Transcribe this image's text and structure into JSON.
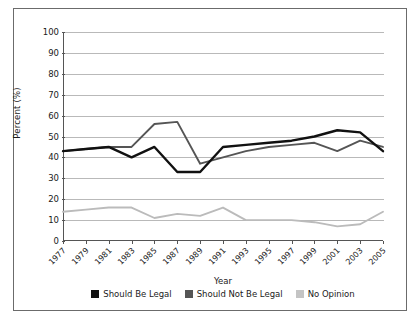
{
  "chart_data": {
    "type": "line",
    "title": "",
    "xlabel": "Year",
    "ylabel": "Percent (%)",
    "ylim": [
      0,
      100
    ],
    "ytick_step": 10,
    "yticks": [
      0,
      10,
      20,
      30,
      40,
      50,
      60,
      70,
      80,
      90,
      100
    ],
    "grid": true,
    "legend_position": "bottom",
    "x": [
      1977,
      1979,
      1981,
      1983,
      1985,
      1987,
      1989,
      1991,
      1993,
      1995,
      1997,
      1999,
      2001,
      2003,
      2005
    ],
    "categories": [
      "1977",
      "1979",
      "1981",
      "1983",
      "1985",
      "1987",
      "1989",
      "1991",
      "1993",
      "1995",
      "1997",
      "1999",
      "2001",
      "2003",
      "2005"
    ],
    "series": [
      {
        "name": "Should Be Legal",
        "color": "#111111",
        "values": [
          43,
          44,
          45,
          40,
          45,
          33,
          33,
          45,
          46,
          47,
          48,
          50,
          53,
          52,
          43
        ]
      },
      {
        "name": "Should Not Be Legal",
        "color": "#555555",
        "values": [
          43,
          44,
          45,
          45,
          56,
          57,
          37,
          40,
          43,
          45,
          46,
          47,
          43,
          48,
          45
        ]
      },
      {
        "name": "No Opinion",
        "color": "#bbbbbb",
        "values": [
          14,
          15,
          16,
          16,
          11,
          13,
          12,
          16,
          10,
          10,
          10,
          9,
          7,
          8,
          14
        ]
      }
    ]
  },
  "axes": {
    "ylabel": "Percent (%)",
    "xlabel": "Year"
  },
  "legend": {
    "items": [
      {
        "label": "Should Be Legal",
        "color": "#111111"
      },
      {
        "label": "Should Not Be Legal",
        "color": "#555555"
      },
      {
        "label": "No Opinion",
        "color": "#c4c4c4"
      }
    ]
  }
}
